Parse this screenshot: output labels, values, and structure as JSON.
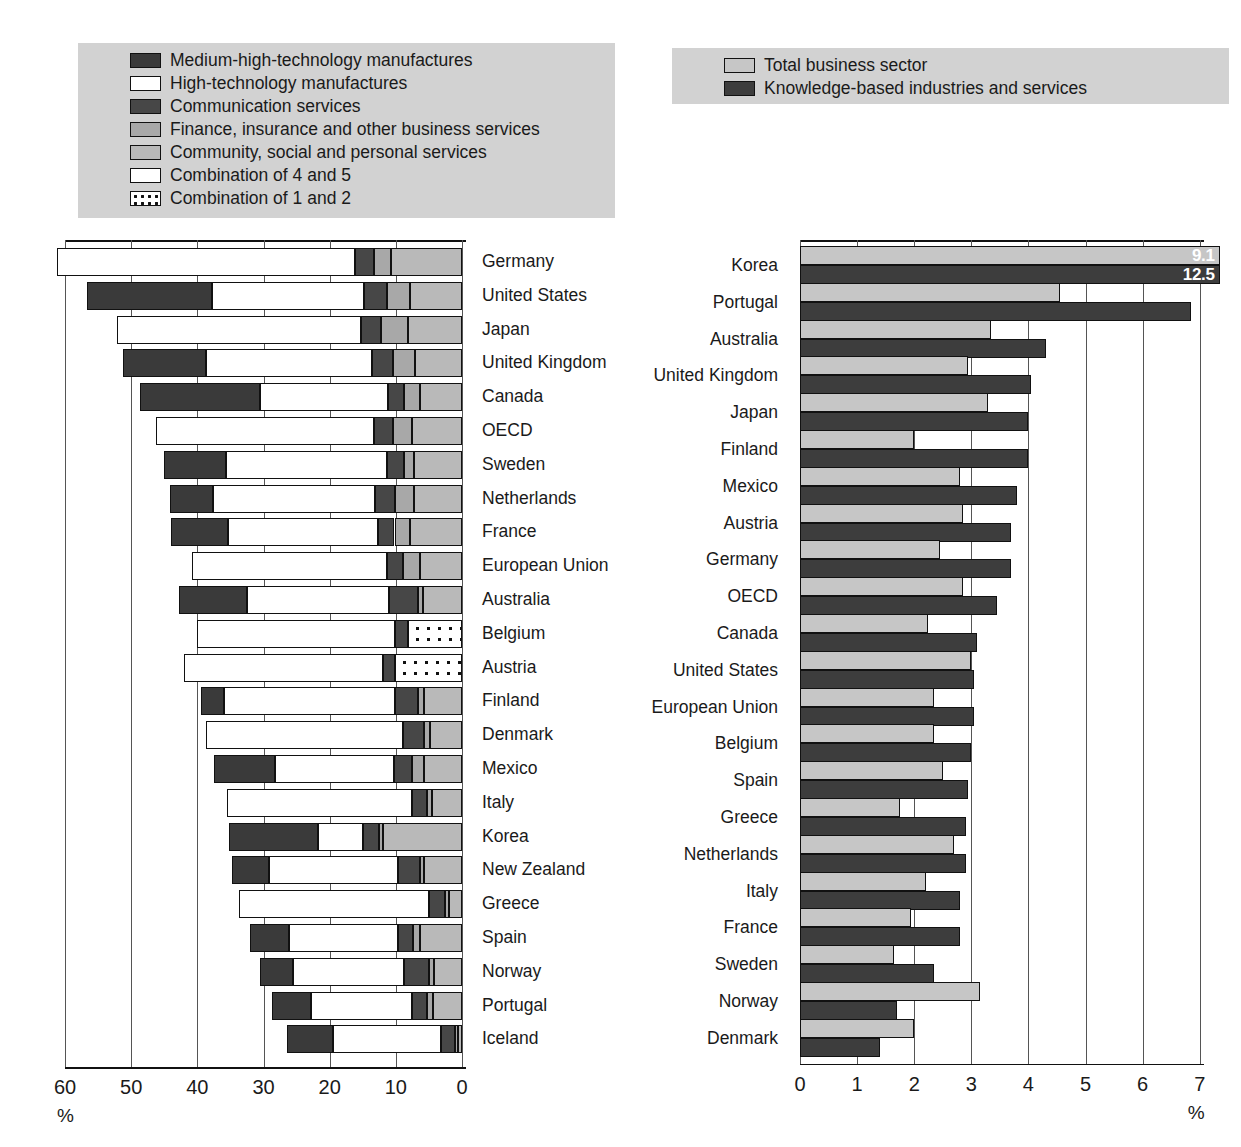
{
  "legend_left": {
    "items": [
      {
        "label": "Medium-high-technology manufactures",
        "key": "mht"
      },
      {
        "label": "High-technology manufactures",
        "key": "ht"
      },
      {
        "label": "Communication services",
        "key": "comm"
      },
      {
        "label": "Finance, insurance and other business services",
        "key": "fin"
      },
      {
        "label": "Community, social and personal services",
        "key": "csp"
      },
      {
        "label": "Combination of 4 and 5",
        "key": "c45"
      },
      {
        "label": "Combination of 1 and 2",
        "key": "c12"
      }
    ]
  },
  "legend_right": {
    "items": [
      {
        "label": "Total business sector",
        "key": "tbs"
      },
      {
        "label": "Knowledge-based industries and services",
        "key": "kbis"
      }
    ]
  },
  "colors": {
    "medium_high_tech": "#3a3a3a",
    "high_tech": "#ffffff",
    "communication": "#474747",
    "finance": "#a8a8a8",
    "community": "#b9b9b9",
    "combination_4_5": "#ffffff",
    "combination_1_2": "#ffffff",
    "total_business_sector": "#c6c6c6",
    "knowledge_based": "#3d3d3d",
    "legend_background": "#d2d2d2",
    "axis": "#111111"
  },
  "chart_data": [
    {
      "type": "bar",
      "id": "left-stacked-bar",
      "orientation": "horizontal-reversed",
      "title": "",
      "xlabel": "%",
      "ylabel": "",
      "xlim": [
        60,
        0
      ],
      "xticks": [
        60,
        50,
        40,
        30,
        20,
        10,
        0
      ],
      "grid": true,
      "legend_position": "top-left",
      "series_keys": [
        "medium_high_tech",
        "high_tech",
        "communication",
        "finance",
        "community",
        "combination_4_5",
        "combination_1_2"
      ],
      "categories": [
        "Germany",
        "United States",
        "Japan",
        "United Kingdom",
        "Canada",
        "OECD",
        "Sweden",
        "Netherlands",
        "France",
        "European Union",
        "Australia",
        "Belgium",
        "Austria",
        "Finland",
        "Denmark",
        "Mexico",
        "Italy",
        "Korea",
        "New Zealand",
        "Greece",
        "Spain",
        "Norway",
        "Portugal",
        "Iceland"
      ],
      "rows": [
        {
          "name": "Germany",
          "total": 61.2,
          "segments": [
            {
              "key": "combination_4_5",
              "value": 45.1
            },
            {
              "key": "communication",
              "value": 2.8
            },
            {
              "key": "finance",
              "value": 2.6
            },
            {
              "key": "community",
              "value": 10.7
            }
          ]
        },
        {
          "name": "United States",
          "total": 56.6,
          "segments": [
            {
              "key": "medium_high_tech",
              "value": 18.8
            },
            {
              "key": "high_tech",
              "value": 23.0
            },
            {
              "key": "communication",
              "value": 3.4
            },
            {
              "key": "finance",
              "value": 3.6
            },
            {
              "key": "community",
              "value": 7.8
            }
          ]
        },
        {
          "name": "Japan",
          "total": 52.2,
          "segments": [
            {
              "key": "combination_4_5",
              "value": 36.9
            },
            {
              "key": "communication",
              "value": 3.0
            },
            {
              "key": "finance",
              "value": 4.2
            },
            {
              "key": "community",
              "value": 8.1
            }
          ]
        },
        {
          "name": "United Kingdom",
          "total": 51.3,
          "segments": [
            {
              "key": "medium_high_tech",
              "value": 12.6
            },
            {
              "key": "high_tech",
              "value": 25.1
            },
            {
              "key": "communication",
              "value": 3.1
            },
            {
              "key": "finance",
              "value": 3.4
            },
            {
              "key": "community",
              "value": 7.1
            }
          ]
        },
        {
          "name": "Canada",
          "total": 48.6,
          "segments": [
            {
              "key": "medium_high_tech",
              "value": 18.0
            },
            {
              "key": "high_tech",
              "value": 19.4
            },
            {
              "key": "communication",
              "value": 2.5
            },
            {
              "key": "finance",
              "value": 2.3
            },
            {
              "key": "community",
              "value": 6.4
            }
          ]
        },
        {
          "name": "OECD",
          "total": 46.3,
          "segments": [
            {
              "key": "combination_4_5",
              "value": 33.0
            },
            {
              "key": "communication",
              "value": 2.8
            },
            {
              "key": "finance",
              "value": 2.9
            },
            {
              "key": "community",
              "value": 7.6
            }
          ]
        },
        {
          "name": "Sweden",
          "total": 45.1,
          "segments": [
            {
              "key": "medium_high_tech",
              "value": 9.4
            },
            {
              "key": "high_tech",
              "value": 24.3
            },
            {
              "key": "communication",
              "value": 2.6
            },
            {
              "key": "finance",
              "value": 1.5
            },
            {
              "key": "community",
              "value": 7.3
            }
          ]
        },
        {
          "name": "Netherlands",
          "total": 44.1,
          "segments": [
            {
              "key": "medium_high_tech",
              "value": 6.4
            },
            {
              "key": "high_tech",
              "value": 24.6
            },
            {
              "key": "communication",
              "value": 3.0
            },
            {
              "key": "finance",
              "value": 2.9
            },
            {
              "key": "community",
              "value": 7.2
            }
          ]
        },
        {
          "name": "France",
          "total": 44.0,
          "segments": [
            {
              "key": "medium_high_tech",
              "value": 8.7
            },
            {
              "key": "high_tech",
              "value": 22.6
            },
            {
              "key": "communication",
              "value": 2.5
            },
            {
              "key": "finance",
              "value": 2.4
            },
            {
              "key": "community",
              "value": 7.8
            }
          ]
        },
        {
          "name": "European Union",
          "total": 40.8,
          "segments": [
            {
              "key": "combination_4_5",
              "value": 29.5
            },
            {
              "key": "communication",
              "value": 2.4
            },
            {
              "key": "finance",
              "value": 2.5
            },
            {
              "key": "community",
              "value": 6.4
            }
          ]
        },
        {
          "name": "Australia",
          "total": 42.7,
          "segments": [
            {
              "key": "medium_high_tech",
              "value": 10.2
            },
            {
              "key": "high_tech",
              "value": 21.4
            },
            {
              "key": "communication",
              "value": 4.5
            },
            {
              "key": "finance",
              "value": 0.7
            },
            {
              "key": "community",
              "value": 5.9
            }
          ]
        },
        {
          "name": "Belgium",
          "total": 40.1,
          "segments": [
            {
              "key": "combination_4_5",
              "value": 30.0
            },
            {
              "key": "communication",
              "value": 2.0
            },
            {
              "key": "combination_1_2",
              "value": 8.1
            }
          ]
        },
        {
          "name": "Austria",
          "total": 42.0,
          "segments": [
            {
              "key": "combination_4_5",
              "value": 30.1
            },
            {
              "key": "communication",
              "value": 1.8
            },
            {
              "key": "combination_1_2",
              "value": 10.1
            }
          ]
        },
        {
          "name": "Finland",
          "total": 39.5,
          "segments": [
            {
              "key": "medium_high_tech",
              "value": 3.6
            },
            {
              "key": "high_tech",
              "value": 25.8
            },
            {
              "key": "communication",
              "value": 3.5
            },
            {
              "key": "finance",
              "value": 0.9
            },
            {
              "key": "community",
              "value": 5.7
            }
          ]
        },
        {
          "name": "Denmark",
          "total": 38.7,
          "segments": [
            {
              "key": "combination_4_5",
              "value": 29.8
            },
            {
              "key": "communication",
              "value": 3.1
            },
            {
              "key": "finance",
              "value": 0.9
            },
            {
              "key": "community",
              "value": 4.9
            }
          ]
        },
        {
          "name": "Mexico",
          "total": 37.5,
          "segments": [
            {
              "key": "medium_high_tech",
              "value": 9.2
            },
            {
              "key": "high_tech",
              "value": 18.0
            },
            {
              "key": "communication",
              "value": 2.7
            },
            {
              "key": "finance",
              "value": 1.8
            },
            {
              "key": "community",
              "value": 5.8
            }
          ]
        },
        {
          "name": "Italy",
          "total": 35.5,
          "segments": [
            {
              "key": "combination_4_5",
              "value": 28.0
            },
            {
              "key": "communication",
              "value": 2.2
            },
            {
              "key": "finance",
              "value": 0.7
            },
            {
              "key": "community",
              "value": 4.6
            }
          ]
        },
        {
          "name": "Korea",
          "total": 35.2,
          "segments": [
            {
              "key": "medium_high_tech",
              "value": 13.4
            },
            {
              "key": "high_tech",
              "value": 6.9
            },
            {
              "key": "communication",
              "value": 2.3
            },
            {
              "key": "finance",
              "value": 0.6
            },
            {
              "key": "community",
              "value": 12.0
            }
          ]
        },
        {
          "name": "New Zealand",
          "total": 34.8,
          "segments": [
            {
              "key": "medium_high_tech",
              "value": 5.6
            },
            {
              "key": "high_tech",
              "value": 19.6
            },
            {
              "key": "communication",
              "value": 3.2
            },
            {
              "key": "finance",
              "value": 0.6
            },
            {
              "key": "community",
              "value": 5.8
            }
          ]
        },
        {
          "name": "Greece",
          "total": 33.7,
          "segments": [
            {
              "key": "combination_4_5",
              "value": 28.7
            },
            {
              "key": "communication",
              "value": 2.5
            },
            {
              "key": "finance",
              "value": 0.5
            },
            {
              "key": "community",
              "value": 2.0
            }
          ]
        },
        {
          "name": "Spain",
          "total": 32.1,
          "segments": [
            {
              "key": "medium_high_tech",
              "value": 6.0
            },
            {
              "key": "high_tech",
              "value": 16.4
            },
            {
              "key": "communication",
              "value": 2.3
            },
            {
              "key": "finance",
              "value": 1.1
            },
            {
              "key": "community",
              "value": 6.3
            }
          ]
        },
        {
          "name": "Norway",
          "total": 30.5,
          "segments": [
            {
              "key": "medium_high_tech",
              "value": 5.0
            },
            {
              "key": "high_tech",
              "value": 16.7
            },
            {
              "key": "communication",
              "value": 3.8
            },
            {
              "key": "finance",
              "value": 0.7
            },
            {
              "key": "community",
              "value": 4.3
            }
          ]
        },
        {
          "name": "Portugal",
          "total": 28.7,
          "segments": [
            {
              "key": "medium_high_tech",
              "value": 5.9
            },
            {
              "key": "high_tech",
              "value": 15.3
            },
            {
              "key": "communication",
              "value": 2.2
            },
            {
              "key": "finance",
              "value": 0.9
            },
            {
              "key": "community",
              "value": 4.4
            }
          ]
        },
        {
          "name": "Iceland",
          "total": 26.4,
          "segments": [
            {
              "key": "medium_high_tech",
              "value": 6.9
            },
            {
              "key": "high_tech",
              "value": 16.4
            },
            {
              "key": "communication",
              "value": 2.0
            },
            {
              "key": "finance",
              "value": 0.5
            },
            {
              "key": "community",
              "value": 0.6
            }
          ]
        }
      ],
      "tick_labels": [
        "60",
        "50",
        "40",
        "30",
        "20",
        "10",
        "0"
      ],
      "unit_label": "%"
    },
    {
      "type": "bar",
      "id": "right-grouped-bar",
      "orientation": "horizontal",
      "title": "",
      "xlabel": "%",
      "ylabel": "",
      "xlim": [
        0,
        7
      ],
      "xticks": [
        0,
        1,
        2,
        3,
        4,
        5,
        6,
        7
      ],
      "grid": true,
      "legend_position": "top",
      "categories": [
        "Korea",
        "Portugal",
        "Australia",
        "United Kingdom",
        "Japan",
        "Finland",
        "Mexico",
        "Austria",
        "Germany",
        "OECD",
        "Canada",
        "United States",
        "European Union",
        "Belgium",
        "Spain",
        "Greece",
        "Netherlands",
        "Italy",
        "France",
        "Sweden",
        "Norway",
        "Denmark"
      ],
      "series": [
        {
          "name": "Total business sector",
          "key": "tbs",
          "values": [
            9.1,
            4.55,
            3.35,
            2.95,
            3.3,
            2.0,
            2.8,
            2.85,
            2.45,
            2.85,
            2.25,
            3.0,
            2.35,
            2.35,
            2.5,
            1.75,
            2.7,
            2.2,
            1.95,
            1.65,
            3.15,
            2.0
          ]
        },
        {
          "name": "Knowledge-based industries and services",
          "key": "kbis",
          "values": [
            12.5,
            6.85,
            4.3,
            4.05,
            4.0,
            4.0,
            3.8,
            3.7,
            3.7,
            3.45,
            3.1,
            3.05,
            3.05,
            3.0,
            2.95,
            2.9,
            2.9,
            2.8,
            2.8,
            2.35,
            1.7,
            1.4
          ]
        }
      ],
      "data_labels": [
        {
          "category": "Korea",
          "series": "Total business sector",
          "text": "9.1"
        },
        {
          "category": "Korea",
          "series": "Knowledge-based industries and services",
          "text": "12.5"
        }
      ],
      "tick_labels": [
        "0",
        "1",
        "2",
        "3",
        "4",
        "5",
        "6",
        "7"
      ],
      "unit_label": "%"
    }
  ]
}
